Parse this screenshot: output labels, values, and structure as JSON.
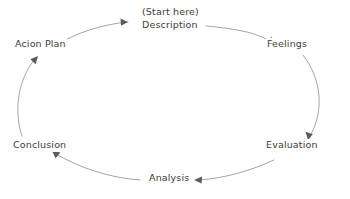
{
  "diagram": {
    "type": "cycle",
    "shape": "ellipse",
    "direction": "clockwise",
    "background_color": "#ffffff",
    "line_color": "#9a9a9a",
    "text_color": "#3c3c3c",
    "stages": [
      {
        "id": "description",
        "label": "Description",
        "annotation": "(Start here)",
        "position": "top"
      },
      {
        "id": "feelings",
        "label": "Feelings",
        "position": "top-right"
      },
      {
        "id": "evaluation",
        "label": "Evaluation",
        "position": "bottom-right"
      },
      {
        "id": "analysis",
        "label": "Analysis",
        "position": "bottom"
      },
      {
        "id": "conclusion",
        "label": "Conclusion",
        "position": "bottom-left"
      },
      {
        "id": "action-plan",
        "label": "Acion Plan",
        "position": "top-left"
      }
    ]
  }
}
